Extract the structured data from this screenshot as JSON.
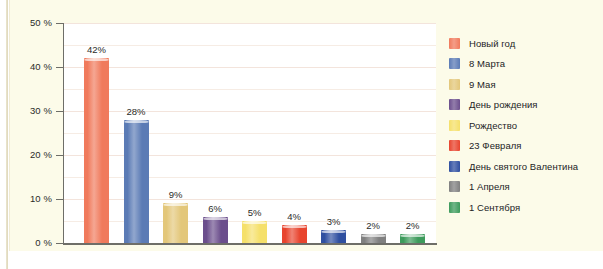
{
  "chart_data": {
    "type": "bar",
    "title": "",
    "subtitle": "",
    "xlabel": "",
    "ylabel": "",
    "ylim": [
      0,
      50
    ],
    "grid": true,
    "legend_position": "right",
    "y_ticks": [
      "0 %",
      "10 %",
      "20 %",
      "30 %",
      "40 %",
      "50 %"
    ],
    "y_tick_values": [
      0,
      10,
      20,
      30,
      40,
      50
    ],
    "categories": [
      "Новый год",
      "8 Марта",
      "9 Мая",
      "День рождения",
      "Рождество",
      "23 Февраля",
      "День святого Валентина",
      "1 Апреля",
      "1 Сентября"
    ],
    "values": [
      42,
      28,
      9,
      6,
      5,
      4,
      3,
      2,
      2
    ],
    "data_labels": [
      "42%",
      "28%",
      "9%",
      "6%",
      "5%",
      "4%",
      "3%",
      "2%",
      "2%"
    ],
    "colors": [
      "#f07a5c",
      "#5b7bb5",
      "#e3c77a",
      "#6b4e8c",
      "#f5e06a",
      "#e8442e",
      "#2f4fa0",
      "#808080",
      "#3d9b5c"
    ]
  },
  "legend": {
    "items": [
      {
        "label": "Новый год",
        "color": "#f07a5c"
      },
      {
        "label": "8 Марта",
        "color": "#5b7bb5"
      },
      {
        "label": "9 Мая",
        "color": "#e3c77a"
      },
      {
        "label": "День рождения",
        "color": "#6b4e8c"
      },
      {
        "label": "Рождество",
        "color": "#f5e06a"
      },
      {
        "label": "23 Февраля",
        "color": "#e8442e"
      },
      {
        "label": "День святого Валентина",
        "color": "#2f4fa0"
      },
      {
        "label": "1 Апреля",
        "color": "#808080"
      },
      {
        "label": "1 Сентября",
        "color": "#3d9b5c"
      }
    ]
  },
  "theme": {
    "paper_background": "#fcfbe9",
    "plot_background": "#ffffff",
    "axis_color": "#6e6e68",
    "gridline_color": "#f3e4dc",
    "text_color": "#2b2b28"
  }
}
